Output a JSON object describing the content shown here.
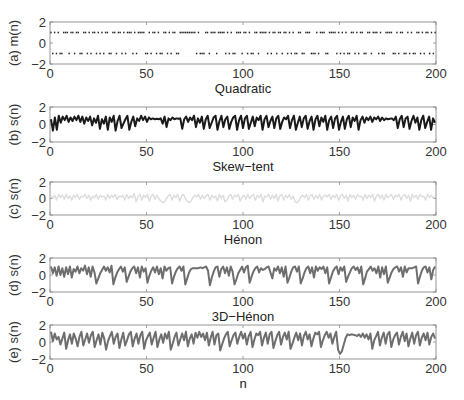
{
  "chart_data": [
    {
      "id": "a",
      "type": "scatter",
      "ylabel": "(a) m(n)",
      "xlabel": "Quadratic",
      "xlim": [
        0,
        200
      ],
      "ylim": [
        -2,
        2
      ],
      "xticks": [
        0,
        50,
        100,
        150,
        200
      ],
      "yticks": [
        -2,
        0,
        2
      ],
      "color": "#222222",
      "line_width": 0,
      "marker": "dot",
      "description": "Binary symbol sequence m(n) in {+1,-1}",
      "values": [
        1,
        -1,
        1,
        -1,
        1,
        -1,
        -1,
        1,
        1,
        1,
        -1,
        1,
        1,
        -1,
        1,
        1,
        -1,
        -1,
        1,
        1,
        -1,
        1,
        -1,
        1,
        1,
        -1,
        1,
        -1,
        1,
        -1,
        1,
        1,
        -1,
        -1,
        1,
        1,
        -1,
        1,
        1,
        -1,
        1,
        -1,
        1,
        1,
        1,
        -1,
        1,
        -1,
        1,
        1,
        1,
        1,
        -1,
        -1,
        1,
        -1,
        1,
        1,
        -1,
        1,
        -1,
        -1,
        1,
        1,
        -1,
        1,
        -1,
        1,
        1,
        -1,
        -1,
        1,
        1,
        1,
        1,
        1,
        1,
        1,
        1,
        1,
        -1,
        1,
        -1,
        -1,
        -1,
        1,
        1,
        -1,
        1,
        1,
        1,
        -1,
        1,
        1,
        1,
        1,
        -1,
        1,
        -1,
        1,
        -1,
        -1,
        1,
        1,
        1,
        -1,
        1,
        1,
        -1,
        1,
        -1,
        -1,
        1,
        1,
        -1,
        1,
        1,
        1,
        1,
        -1,
        1,
        -1,
        1,
        1,
        -1,
        1,
        1,
        -1,
        1,
        1,
        -1,
        1,
        -1,
        1,
        -1,
        -1,
        1,
        1,
        -1,
        -1,
        1,
        1,
        1,
        -1,
        -1,
        -1,
        1,
        -1,
        1,
        1,
        1,
        -1,
        -1,
        1,
        1,
        1,
        1,
        -1,
        1,
        -1,
        1,
        -1,
        1,
        -1,
        -1,
        1,
        1,
        -1,
        1,
        -1,
        1,
        1,
        -1,
        -1,
        1,
        1,
        -1,
        1,
        1,
        1,
        -1,
        1,
        -1,
        -1,
        1,
        1,
        1,
        1,
        -1,
        -1,
        1,
        -1,
        1,
        1,
        -1,
        -1,
        1,
        -1,
        1,
        -1,
        -1,
        1,
        1,
        -1,
        1,
        -1,
        1,
        1,
        -1,
        1,
        -1,
        1
      ]
    },
    {
      "id": "b",
      "type": "line",
      "ylabel": "(b) s(n)",
      "xlabel": "Skew−tent",
      "xlim": [
        0,
        200
      ],
      "ylim": [
        -2,
        2
      ],
      "xticks": [
        0,
        50,
        100,
        150,
        200
      ],
      "yticks": [
        -2,
        0,
        2
      ],
      "color": "#1a1a1a",
      "line_width": 2.0,
      "values": [
        0.6,
        -0.7,
        0.8,
        -0.6,
        1.0,
        0.2,
        0.9,
        0.5,
        1.0,
        0.3,
        0.8,
        0.4,
        0.9,
        0.5,
        1.0,
        0.3,
        0.9,
        0.1,
        0.8,
        0.4,
        0.9,
        -0.1,
        0.7,
        0.2,
        1.0,
        -0.5,
        0.6,
        0.1,
        0.9,
        -0.6,
        0.8,
        0.3,
        1.0,
        -0.7,
        0.4,
        1.0,
        -0.4,
        0.1,
        0.6,
        1.0,
        -0.6,
        0.3,
        0.9,
        -0.2,
        0.7,
        0.4,
        1.0,
        0.5,
        0.9,
        0.3,
        0.8,
        0.6,
        0.7,
        0.6,
        0.65,
        0.6,
        0.7,
        0.1,
        0.9,
        -0.3,
        0.7,
        0.5,
        0.8,
        0.6,
        0.7,
        0.65,
        0.7,
        -0.5,
        0.6,
        0.9,
        0.3,
        0.8,
        0.5,
        1.0,
        -0.3,
        0.7,
        0.2,
        0.9,
        -0.5,
        0.6,
        1.0,
        -0.4,
        0.2,
        0.8,
        1.0,
        -0.6,
        0.4,
        1.0,
        -0.3,
        0.6,
        0.9,
        -0.5,
        0.3,
        0.8,
        1.0,
        -0.6,
        0.5,
        1.0,
        -0.4,
        0.7,
        1.0,
        -0.5,
        0.2,
        0.9,
        -0.2,
        0.8,
        0.5,
        1.0,
        -0.6,
        0.6,
        1.0,
        -0.3,
        0.4,
        0.9,
        -0.4,
        0.7,
        1.0,
        -0.5,
        0.3,
        0.8,
        0.6,
        1.0,
        -0.4,
        0.5,
        1.0,
        -0.6,
        0.2,
        0.9,
        -0.3,
        0.7,
        1.0,
        -0.5,
        0.4,
        0.9,
        -0.6,
        0.6,
        1.0,
        -0.2,
        0.8,
        0.3,
        1.0,
        -0.6,
        0.5,
        0.9,
        -0.4,
        0.7,
        1.0,
        -0.6,
        0.3,
        0.9,
        -0.5,
        0.6,
        1.0,
        -0.3,
        0.8,
        0.4,
        1.0,
        -0.6,
        0.5,
        0.9,
        0.2,
        0.8,
        0.5,
        0.9,
        0.3,
        0.8,
        0.6,
        0.9,
        0.4,
        0.8,
        0.5,
        0.7,
        0.6,
        0.65,
        0.7,
        0.5,
        0.9,
        -0.4,
        0.6,
        1.0,
        -0.3,
        0.7,
        0.9,
        -0.5,
        0.4,
        1.0,
        0.2,
        0.8,
        -0.6,
        0.5,
        1.0,
        -0.4,
        0.3,
        0.9,
        -0.6,
        0.7,
        0.2
      ]
    },
    {
      "id": "c",
      "type": "line",
      "ylabel": "(c) s(n)",
      "xlabel": "Hénon",
      "xlim": [
        0,
        200
      ],
      "ylim": [
        -2,
        2
      ],
      "xticks": [
        0,
        50,
        100,
        150,
        200
      ],
      "yticks": [
        -2,
        0,
        2
      ],
      "color": "#dcdcdc",
      "line_width": 1.4,
      "values": [
        0.3,
        0.0,
        0.4,
        -0.2,
        0.5,
        0.1,
        0.4,
        -0.1,
        0.5,
        0.0,
        0.3,
        -0.2,
        0.4,
        0.1,
        0.5,
        -0.1,
        0.3,
        0.2,
        0.5,
        0.0,
        0.4,
        -0.2,
        0.3,
        0.1,
        0.5,
        -0.1,
        0.4,
        0.2,
        0.3,
        -0.2,
        0.5,
        0.0,
        0.4,
        0.1,
        0.5,
        -0.1,
        0.3,
        0.2,
        0.4,
        -0.2,
        0.5,
        0.0,
        0.3,
        0.1,
        0.6,
        -0.4,
        0.2,
        0.5,
        -0.2,
        0.4,
        0.1,
        0.5,
        -0.3,
        0.3,
        0.5,
        -0.1,
        0.4,
        0.0,
        -0.3,
        -0.5,
        -0.4,
        0.0,
        0.3,
        0.5,
        -0.2,
        0.4,
        0.1,
        0.5,
        -0.3,
        0.3,
        0.5,
        0.0,
        -0.3,
        -0.5,
        -0.3,
        0.1,
        0.4,
        0.2,
        0.5,
        -0.1,
        0.4,
        0.0,
        0.3,
        0.5,
        -0.2,
        0.4,
        0.1,
        0.3,
        -0.3,
        0.5,
        0.0,
        0.4,
        -0.4,
        -0.2,
        0.3,
        0.5,
        -0.1,
        0.4,
        0.2,
        0.5,
        -0.3,
        0.2,
        0.4,
        -0.1,
        0.5,
        0.0,
        0.3,
        0.5,
        -0.2,
        0.4,
        0.1,
        0.5,
        -0.4,
        0.3,
        0.2,
        0.5,
        -0.1,
        0.4,
        0.0,
        0.5,
        -0.3,
        0.3,
        0.5,
        -0.2,
        0.4,
        0.1,
        0.5,
        -0.1,
        0.3,
        -0.4,
        -0.5,
        -0.3,
        0.2,
        0.4,
        0.1,
        0.5,
        -0.2,
        0.3,
        0.5,
        -0.1,
        0.4,
        0.0,
        0.5,
        -0.2,
        0.3,
        0.4,
        0.2,
        0.5,
        -0.1,
        0.4,
        0.1,
        0.5,
        -0.2,
        0.3,
        0.5,
        0.0,
        0.4,
        -0.3,
        0.5,
        0.1,
        0.4,
        -0.1,
        0.5,
        0.2,
        0.3,
        -0.2,
        0.5,
        0.0,
        0.4,
        0.1,
        0.5,
        -0.3,
        0.3,
        0.5,
        0.0,
        0.4,
        -0.2,
        0.5,
        0.1,
        0.3,
        0.5,
        -0.1,
        0.4,
        0.2,
        0.5,
        -0.2,
        0.3,
        0.5,
        0.0,
        0.4,
        -0.3,
        0.5,
        0.1,
        0.4,
        -0.1,
        0.5,
        0.2,
        0.3,
        -0.2,
        0.5,
        0.1,
        0.4,
        0.0,
        0.3
      ]
    },
    {
      "id": "d",
      "type": "line",
      "ylabel": "(d) s(n)",
      "xlabel": "3D−Hénon",
      "xlim": [
        0,
        200
      ],
      "ylim": [
        -2,
        2
      ],
      "xticks": [
        0,
        50,
        100,
        150,
        200
      ],
      "yticks": [
        -2,
        0,
        2
      ],
      "color": "#6e6e6e",
      "line_width": 2.0,
      "values": [
        1.0,
        0.2,
        0.9,
        -0.1,
        1.0,
        0.0,
        0.8,
        -0.2,
        0.9,
        0.1,
        1.0,
        -0.3,
        0.7,
        0.4,
        1.0,
        0.2,
        0.8,
        0.5,
        1.1,
        0.1,
        0.9,
        -0.2,
        1.0,
        0.3,
        -1.0,
        -0.4,
        0.2,
        0.6,
        1.0,
        0.5,
        0.9,
        0.3,
        1.1,
        -1.1,
        -0.3,
        0.3,
        0.7,
        1.0,
        0.4,
        0.9,
        -0.8,
        -0.2,
        0.4,
        0.8,
        1.0,
        0.2,
        0.9,
        -0.3,
        1.0,
        0.4,
        0.8,
        -0.9,
        -0.1,
        0.5,
        0.9,
        0.3,
        1.0,
        0.1,
        0.8,
        -0.4,
        1.0,
        0.5,
        0.8,
        0.9,
        -1.0,
        -0.2,
        0.4,
        0.8,
        1.0,
        0.5,
        1.0,
        -1.1,
        -0.4,
        0.3,
        0.7,
        0.8,
        0.8,
        0.8,
        0.8,
        0.9,
        0.8,
        0.9,
        1.0,
        0.5,
        -1.2,
        -0.3,
        0.4,
        0.9,
        1.0,
        -0.2,
        0.7,
        1.0,
        0.2,
        0.9,
        -0.1,
        1.0,
        0.4,
        -1.1,
        -0.5,
        0.2,
        0.6,
        1.0,
        0.3,
        0.9,
        1.1,
        -0.9,
        -0.2,
        0.4,
        0.8,
        1.0,
        0.3,
        0.8,
        0.6,
        0.7,
        0.9,
        1.0,
        0.3,
        -0.4,
        0.8,
        0.5,
        1.0,
        0.2,
        0.9,
        -0.2,
        1.0,
        -0.9,
        -0.3,
        0.4,
        0.9,
        1.0,
        0.4,
        1.0,
        -1.0,
        -0.4,
        0.3,
        0.8,
        1.0,
        0.2,
        0.9,
        -0.3,
        1.0,
        0.5,
        0.9,
        0.7,
        1.0,
        0.2,
        0.9,
        -1.0,
        -0.3,
        0.4,
        0.8,
        1.0,
        0.1,
        0.9,
        0.5,
        1.0,
        -0.8,
        -0.2,
        0.3,
        0.8,
        1.0,
        0.6,
        0.9,
        0.2,
        1.0,
        -1.1,
        -0.4,
        0.4,
        0.7,
        1.0,
        0.5,
        0.8,
        0.2,
        1.0,
        -0.3,
        0.9,
        0.1,
        1.0,
        -0.9,
        -0.3,
        0.3,
        0.7,
        0.9,
        1.0,
        0.4,
        0.9,
        -0.2,
        1.0,
        0.3,
        0.8,
        0.8,
        0.8,
        0.9,
        1.0,
        -1.0,
        -0.2,
        0.5,
        0.9,
        1.0,
        0.3,
        0.9,
        -0.5,
        0.6,
        1.0
      ]
    },
    {
      "id": "e",
      "type": "line",
      "ylabel": "(e) s(n)",
      "xlabel": "n",
      "xlim": [
        0,
        200
      ],
      "ylim": [
        -2,
        2
      ],
      "xticks": [
        0,
        50,
        100,
        150,
        200
      ],
      "yticks": [
        -2,
        0,
        2
      ],
      "color": "#6e6e6e",
      "line_width": 2.0,
      "values": [
        1.2,
        0.1,
        1.0,
        0.3,
        0.6,
        -0.3,
        0.4,
        1.1,
        -0.8,
        0.2,
        0.9,
        -0.2,
        1.0,
        0.4,
        -0.5,
        0.6,
        1.2,
        -0.4,
        0.3,
        1.0,
        -0.1,
        0.8,
        1.2,
        -0.6,
        0.2,
        0.9,
        -0.3,
        1.1,
        0.4,
        -0.9,
        0.1,
        0.7,
        1.2,
        -0.2,
        0.6,
        1.0,
        -0.7,
        0.3,
        1.1,
        -0.4,
        0.2,
        0.9,
        1.2,
        -0.5,
        0.4,
        1.0,
        -0.2,
        0.8,
        1.2,
        -0.8,
        0.2,
        0.7,
        1.1,
        -0.3,
        0.5,
        1.2,
        -0.6,
        0.3,
        0.9,
        -0.1,
        1.0,
        0.4,
        1.2,
        -0.9,
        -0.2,
        0.6,
        1.1,
        -0.4,
        0.3,
        1.0,
        0.2,
        1.2,
        -0.5,
        0.4,
        0.9,
        -0.2,
        1.1,
        0.5,
        1.2,
        0.6,
        1.0,
        0.2,
        1.1,
        -0.4,
        0.5,
        1.2,
        -0.3,
        0.8,
        1.0,
        -1.0,
        -0.3,
        0.4,
        0.9,
        1.2,
        -0.5,
        0.2,
        0.8,
        1.1,
        -0.2,
        0.6,
        1.2,
        0.4,
        1.0,
        -0.3,
        0.7,
        1.2,
        -0.6,
        0.3,
        1.0,
        0.8,
        1.2,
        -0.4,
        0.5,
        1.1,
        -0.2,
        0.9,
        1.2,
        -0.7,
        0.1,
        0.8,
        1.2,
        -0.3,
        0.6,
        1.1,
        0.3,
        1.2,
        -0.8,
        -0.2,
        0.5,
        1.1,
        0.2,
        1.0,
        -0.4,
        0.7,
        1.2,
        0.3,
        0.9,
        -0.5,
        0.4,
        1.1,
        0.9,
        1.2,
        -0.6,
        0.2,
        0.8,
        1.2,
        0.5,
        1.0,
        -0.2,
        0.6,
        1.2,
        -0.9,
        -1.4,
        -1.1,
        -0.3,
        0.5,
        0.9,
        0.8,
        0.9,
        0.85,
        0.8,
        0.7,
        0.9,
        0.6,
        1.0,
        0.5,
        0.9,
        0.3,
        1.0,
        -0.8,
        0.2,
        0.7,
        1.2,
        -0.4,
        0.5,
        1.1,
        -0.2,
        0.9,
        1.2,
        -0.6,
        0.3,
        0.8,
        1.1,
        -0.3,
        0.6,
        1.2,
        0.1,
        1.0,
        -0.5,
        0.4,
        1.1,
        -0.2,
        0.8,
        1.2,
        -0.4,
        0.5,
        1.0,
        0.2,
        1.1,
        -0.3,
        0.6,
        1.0,
        0.4
      ]
    }
  ],
  "layout": {
    "plot_left": 50,
    "plot_right": 436,
    "panels_y": [
      [
        22,
        64
      ],
      [
        107,
        142
      ],
      [
        182,
        215
      ],
      [
        258,
        292
      ],
      [
        325,
        359
      ]
    ]
  }
}
